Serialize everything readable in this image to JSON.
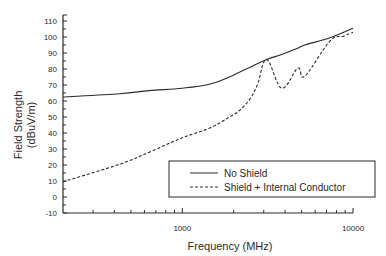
{
  "chart_data": {
    "type": "line",
    "title": "",
    "xlabel": "Frequency (MHz)",
    "ylabel": "Field Strength (dBuV/m)",
    "ylabel_lines": [
      "Field Strength",
      "(dBuV/m)"
    ],
    "xscale": "log",
    "xlim": [
      200,
      10000
    ],
    "ylim": [
      -10,
      110
    ],
    "x_tick_labels": [
      "1000",
      "10000"
    ],
    "x_ticks": [
      1000,
      10000
    ],
    "x_minor_ticks": [
      300,
      400,
      500,
      600,
      700,
      800,
      900,
      2000,
      3000,
      4000,
      5000,
      6000,
      7000,
      8000,
      9000
    ],
    "y_ticks": [
      -10,
      0,
      10,
      20,
      30,
      40,
      50,
      60,
      70,
      80,
      90,
      100,
      110
    ],
    "y_tick_labels": [
      "-10",
      "0",
      "10",
      "20",
      "30",
      "40",
      "50",
      "60",
      "70",
      "80",
      "90",
      "100",
      "110"
    ],
    "grid": false,
    "legend_position": "lower right",
    "series": [
      {
        "name": "No Shield",
        "style": "solid",
        "x": [
          200,
          430,
          640,
          1000,
          1440,
          1890,
          2160,
          2480,
          3120,
          3820,
          4750,
          5220,
          7330,
          10000
        ],
        "values": [
          62.5,
          64.5,
          66.5,
          68,
          70.5,
          75,
          78,
          81,
          86,
          89,
          93,
          95,
          99.5,
          105.5
        ]
      },
      {
        "name": "Shield + Internal Conductor",
        "style": "dashed",
        "x": [
          200,
          430,
          640,
          1000,
          1440,
          1890,
          2160,
          2480,
          2750,
          3120,
          3820,
          4750,
          5220,
          7330,
          8800,
          10000
        ],
        "values": [
          9.5,
          20.5,
          28,
          37,
          43,
          50,
          54,
          61,
          70,
          86,
          68,
          80.5,
          75.5,
          97.5,
          100.5,
          103
        ]
      }
    ]
  },
  "legend": {
    "items": [
      {
        "label": "No Shield",
        "style": "solid"
      },
      {
        "label": "Shield + Internal Conductor",
        "style": "dashed"
      }
    ]
  },
  "colors": {
    "line": "#2a2a2a",
    "axis": "#2a2a2a",
    "background": "#ffffff"
  }
}
